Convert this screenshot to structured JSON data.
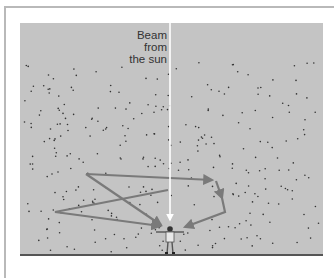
{
  "figure": {
    "label_line1": "Beam from",
    "label_line2": "the sun",
    "colors": {
      "sky": "#c4c4c4",
      "beam": "#ffffff",
      "scatter_path": "#7a7a7a",
      "particles": "#333333",
      "ground": "#555555",
      "frame": "#b9b9b9"
    },
    "elements": {
      "beam": "vertical sunbeam from top to observer",
      "observer": "person standing with arms outstretched on ground",
      "scatter_paths": 3,
      "particles": "air molecules scattered as dots"
    }
  }
}
